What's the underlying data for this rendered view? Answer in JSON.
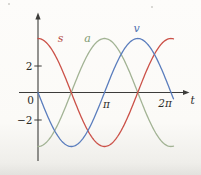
{
  "chart_data": {
    "type": "line",
    "title": "",
    "xlabel": "t",
    "ylabel": "",
    "grid": false,
    "legend": "inline-curve-labels",
    "x_axis": {
      "origin_label": "0",
      "domain_rad": [
        0,
        6.4
      ],
      "ticks": [
        {
          "t_over_pi": 1,
          "label": "π"
        },
        {
          "t_over_pi": 2,
          "label": "2π"
        }
      ]
    },
    "y_axis": {
      "range": [
        -4.6,
        4.6
      ],
      "ticks": [
        {
          "value": 2,
          "label": "2"
        },
        {
          "value": -2,
          "label": "−2"
        }
      ]
    },
    "sample_t_over_pi": [
      0,
      0.25,
      0.5,
      0.75,
      1,
      1.25,
      1.5,
      1.75,
      2
    ],
    "series": [
      {
        "name": "s",
        "fn_key": "cos",
        "amplitude": 4,
        "color": "#cb5148",
        "label_color": "#b24a41",
        "label_pos": {
          "x": 60.5,
          "y": 42
        },
        "values_at_quarter_pi": [
          4,
          2.83,
          0,
          -2.83,
          -4,
          -2.83,
          0,
          2.83,
          4
        ]
      },
      {
        "name": "a",
        "fn_key": "neg_cos",
        "amplitude": 4,
        "color": "#a2b394",
        "label_color": "#7e9a70",
        "label_pos": {
          "x": 87.5,
          "y": 42
        },
        "values_at_quarter_pi": [
          -4,
          -2.83,
          0,
          2.83,
          4,
          2.83,
          0,
          -2.83,
          -4
        ]
      },
      {
        "name": "v",
        "fn_key": "neg_sin",
        "amplitude": 4,
        "color": "#5a7dbd",
        "label_color": "#4e6fb0",
        "label_pos": {
          "x": 136.5,
          "y": 31.5
        },
        "values_at_quarter_pi": [
          0,
          -2.83,
          -4,
          -2.83,
          0,
          2.83,
          4,
          2.83,
          0
        ]
      }
    ],
    "draw_order": [
      "a",
      "s",
      "v"
    ]
  }
}
